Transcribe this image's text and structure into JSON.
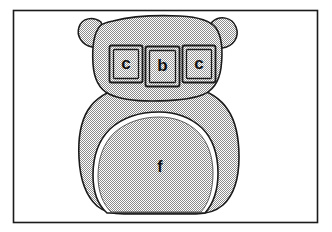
{
  "figure": {
    "frame": {
      "border_color": "#1a1a1a",
      "background_color": "#ffffff"
    },
    "bear": {
      "fill_color": "#b3b3b3",
      "outline_color": "#1a1a1a",
      "pattern": "halftone-dither-50",
      "parts": [
        {
          "name": "left-ear"
        },
        {
          "name": "right-ear"
        },
        {
          "name": "head"
        },
        {
          "name": "body"
        },
        {
          "name": "belly-patch"
        }
      ]
    },
    "blocks": [
      {
        "letter": "c",
        "position": "left"
      },
      {
        "letter": "b",
        "position": "center"
      },
      {
        "letter": "c",
        "position": "right"
      }
    ],
    "belly": {
      "letter": "f"
    }
  }
}
